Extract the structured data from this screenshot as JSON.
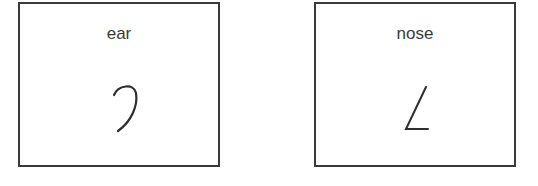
{
  "cards": [
    {
      "label": "ear",
      "icon": "ear-stroke-icon"
    },
    {
      "label": "nose",
      "icon": "nose-stroke-icon"
    }
  ]
}
